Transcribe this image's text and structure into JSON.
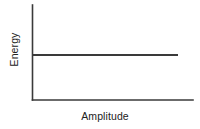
{
  "figure": {
    "width": 200,
    "height": 129,
    "background": "#ffffff",
    "line_color": "#3a3a3a",
    "text_color": "#222222"
  },
  "chart_data": {
    "type": "line",
    "title": "",
    "subtitle": "",
    "xlabel": "Amplitude",
    "ylabel": "Energy",
    "x": [
      0,
      1
    ],
    "series": [
      {
        "name": "energy",
        "values": [
          0.5,
          0.5
        ]
      }
    ],
    "xlim": [
      0,
      1
    ],
    "ylim": [
      0,
      1
    ],
    "xticks": [],
    "yticks": [],
    "xticklabels": [],
    "yticklabels": [],
    "grid": false,
    "legend": false,
    "legend_position": "none",
    "annotations": []
  },
  "axes": {
    "y_axis": {
      "x": 32.5,
      "y_top": 5,
      "y_bottom": 100
    },
    "x_axis": {
      "y": 100,
      "x_left": 32.5,
      "x_right": 193
    },
    "data_line": {
      "y": 55,
      "x_start": 33,
      "x_end": 178
    }
  }
}
